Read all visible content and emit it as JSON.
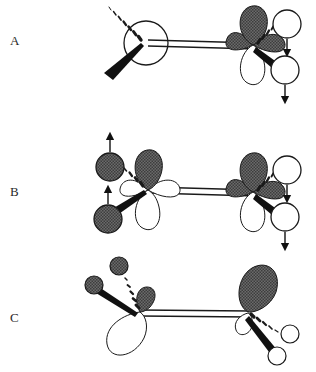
{
  "figure": {
    "type": "chemical-structure-diagram",
    "width": 316,
    "height": 372,
    "background_color": "#ffffff",
    "line_color": "#1a1a1a",
    "shaded_fill": "#5a5a5a",
    "open_fill": "#ffffff"
  },
  "panels": [
    {
      "id": "A",
      "label": "A",
      "label_x": 10,
      "label_y": 33,
      "description": "Double bond with right-hand p-orbital; two open substituent circles with downward arrows",
      "bond": {
        "type": "double",
        "x1": 150,
        "y1": 42,
        "x2": 253,
        "y2": 45
      },
      "left_center": {
        "type": "open-circle",
        "cx": 146,
        "cy": 43,
        "r": 22
      },
      "right_center": {
        "type": "p-orbital",
        "cx": 253,
        "cy": 45
      },
      "substituents": [
        {
          "shape": "open-circle",
          "cx": 285,
          "cy": 26,
          "r": 14,
          "bond": "hashed",
          "arrow": "down"
        },
        {
          "shape": "open-circle",
          "cx": 283,
          "cy": 70,
          "r": 14,
          "bond": "bold-wedge",
          "arrow": "down"
        }
      ],
      "left_bonds": [
        {
          "style": "hashed",
          "to_x": 108,
          "to_y": 16
        },
        {
          "style": "bold-wedge",
          "to_x": 105,
          "to_y": 78
        }
      ]
    },
    {
      "id": "B",
      "label": "B",
      "label_x": 10,
      "label_y": 184,
      "description": "Double bond with p-orbitals on both centers; shaded circles with up arrows at left, open circles with down arrows at right",
      "bond": {
        "type": "double",
        "x1": 148,
        "y1": 190,
        "x2": 253,
        "y2": 192
      },
      "left_center": {
        "type": "p-orbital",
        "cx": 148,
        "cy": 190
      },
      "right_center": {
        "type": "p-orbital",
        "cx": 253,
        "cy": 192
      },
      "substituents": [
        {
          "shape": "shaded-circle",
          "cx": 110,
          "cy": 168,
          "r": 14,
          "bond": "hashed",
          "arrow": "up"
        },
        {
          "shape": "shaded-circle",
          "cx": 108,
          "cy": 220,
          "r": 14,
          "bond": "bold-wedge",
          "arrow": "up"
        },
        {
          "shape": "open-circle",
          "cx": 285,
          "cy": 172,
          "r": 14,
          "bond": "hashed",
          "arrow": "down"
        },
        {
          "shape": "open-circle",
          "cx": 283,
          "cy": 216,
          "r": 14,
          "bond": "bold-wedge",
          "arrow": "down"
        }
      ]
    },
    {
      "id": "C",
      "label": "C",
      "label_x": 10,
      "label_y": 310,
      "description": "Rotated orbitals, no motion arrows; small shaded circles at left, open circles at right",
      "bond": {
        "type": "double",
        "x1": 142,
        "y1": 312,
        "x2": 248,
        "y2": 313
      },
      "left_center": {
        "type": "rotated-orbital",
        "cx": 142,
        "cy": 312,
        "rotation": -35
      },
      "right_center": {
        "type": "rotated-orbital",
        "cx": 248,
        "cy": 313,
        "rotation": 20
      },
      "substituents": [
        {
          "shape": "shaded-circle",
          "cx": 117,
          "cy": 266,
          "r": 9,
          "bond": "hashed"
        },
        {
          "shape": "shaded-circle",
          "cx": 95,
          "cy": 285,
          "r": 9,
          "bond": "bold-wedge"
        },
        {
          "shape": "open-circle",
          "cx": 292,
          "cy": 334,
          "r": 9,
          "bond": "hashed"
        },
        {
          "shape": "open-circle",
          "cx": 277,
          "cy": 355,
          "r": 9,
          "bond": "bold-wedge"
        }
      ]
    }
  ],
  "legend": {
    "arrow_up_meaning": "up-arrow",
    "arrow_down_meaning": "down-arrow",
    "hashed_bond": "hashed-wedge-bond",
    "bold_bond": "bold-wedge-bond"
  }
}
